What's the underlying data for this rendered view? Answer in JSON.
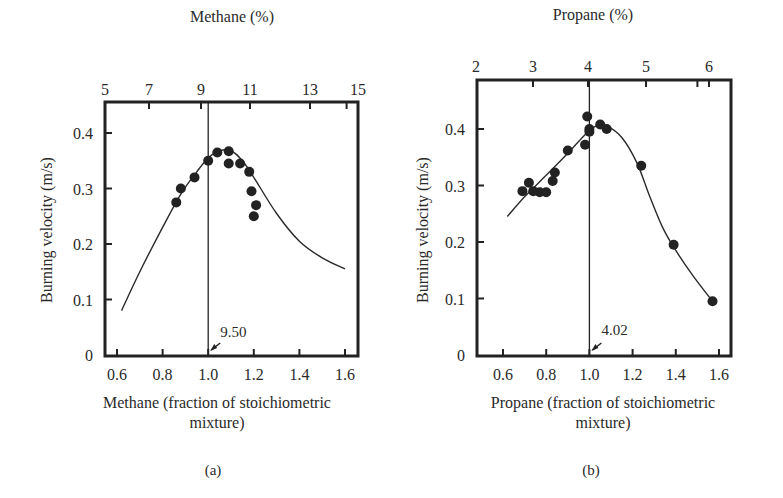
{
  "figure": {
    "panels": [
      {
        "id": "a",
        "caption": "(a)"
      },
      {
        "id": "b",
        "caption": "(b)"
      }
    ]
  },
  "chart_data": [
    {
      "type": "scatter",
      "panel": "(a)",
      "title": "",
      "top_axis_label": "Methane (%)",
      "top_ticks": [
        "5",
        "7",
        "9",
        "11",
        "13",
        "15"
      ],
      "top_tick_positions": [
        0.536,
        0.643,
        0.964,
        1.179,
        1.393,
        1.607
      ],
      "xlabel": "Methane (fraction of stoichiometric mixture)",
      "xlabel_lines": [
        "Methane (fraction of stoichiometric",
        "mixture)"
      ],
      "ylabel": "Burning velocity (m/s)",
      "xticks": [
        "0.6",
        "0.8",
        "1.0",
        "1.2",
        "1.4",
        "1.6"
      ],
      "yticks": [
        "0",
        "0.1",
        "0.2",
        "0.3",
        "0.4"
      ],
      "xlim": [
        0.55,
        1.65
      ],
      "ylim": [
        0,
        0.4
      ],
      "grid": false,
      "legend": null,
      "stoichiometric_line_x": 1.0,
      "annotation": {
        "text": "9.50",
        "x": 1.0,
        "y": 0.0,
        "meaning": "stoichiometric methane %"
      },
      "series": [
        {
          "name": "measured",
          "kind": "points",
          "x": [
            0.86,
            0.88,
            0.94,
            1.0,
            1.04,
            1.09,
            1.09,
            1.14,
            1.18,
            1.19,
            1.21,
            1.2
          ],
          "y": [
            0.275,
            0.3,
            0.32,
            0.35,
            0.365,
            0.367,
            0.345,
            0.345,
            0.33,
            0.295,
            0.27,
            0.25
          ]
        },
        {
          "name": "fitted curve",
          "kind": "line",
          "x": [
            0.62,
            0.7,
            0.8,
            0.88,
            0.95,
            1.0,
            1.05,
            1.1,
            1.15,
            1.2,
            1.3,
            1.4,
            1.5,
            1.6
          ],
          "y": [
            0.08,
            0.15,
            0.23,
            0.29,
            0.33,
            0.355,
            0.368,
            0.368,
            0.35,
            0.32,
            0.255,
            0.205,
            0.175,
            0.155
          ]
        }
      ]
    },
    {
      "type": "scatter",
      "panel": "(b)",
      "title": "",
      "top_axis_label": "Propane (%)",
      "top_ticks": [
        "2",
        "3",
        "4",
        "5",
        "6"
      ],
      "top_tick_positions": [
        0.5,
        0.75,
        1.0,
        1.25,
        1.5
      ],
      "xlabel": "Propane (fraction of stoichiometric mixture)",
      "xlabel_lines": [
        "Propane (fraction of stoichiometric",
        "mixture)"
      ],
      "ylabel": "Burning velocity (m/s)",
      "xticks": [
        "0.6",
        "0.8",
        "1.0",
        "1.2",
        "1.4",
        "1.6"
      ],
      "yticks": [
        "0",
        "0.1",
        "0.2",
        "0.3",
        "0.4"
      ],
      "xlim": [
        0.48,
        1.63
      ],
      "ylim": [
        0,
        0.4
      ],
      "grid": false,
      "legend": null,
      "stoichiometric_line_x": 1.0,
      "annotation": {
        "text": "4.02",
        "x": 1.0,
        "y": 0.0,
        "meaning": "stoichiometric propane %"
      },
      "series": [
        {
          "name": "measured",
          "kind": "points",
          "x": [
            0.69,
            0.72,
            0.74,
            0.77,
            0.8,
            0.83,
            0.84,
            0.9,
            0.98,
            1.0,
            0.99,
            1.0,
            1.05,
            1.08,
            1.24,
            1.39,
            1.57
          ],
          "y": [
            0.29,
            0.305,
            0.29,
            0.288,
            0.288,
            0.308,
            0.323,
            0.362,
            0.372,
            0.395,
            0.422,
            0.4,
            0.408,
            0.4,
            0.335,
            0.195,
            0.095
          ],
          "notes": "approximate positions read from figure"
        },
        {
          "name": "fitted curve",
          "kind": "line",
          "x": [
            0.62,
            0.7,
            0.8,
            0.9,
            0.98,
            1.03,
            1.08,
            1.15,
            1.22,
            1.28,
            1.34,
            1.4,
            1.48,
            1.57
          ],
          "y": [
            0.245,
            0.28,
            0.318,
            0.357,
            0.39,
            0.405,
            0.405,
            0.385,
            0.34,
            0.28,
            0.225,
            0.185,
            0.14,
            0.095
          ]
        }
      ]
    }
  ]
}
